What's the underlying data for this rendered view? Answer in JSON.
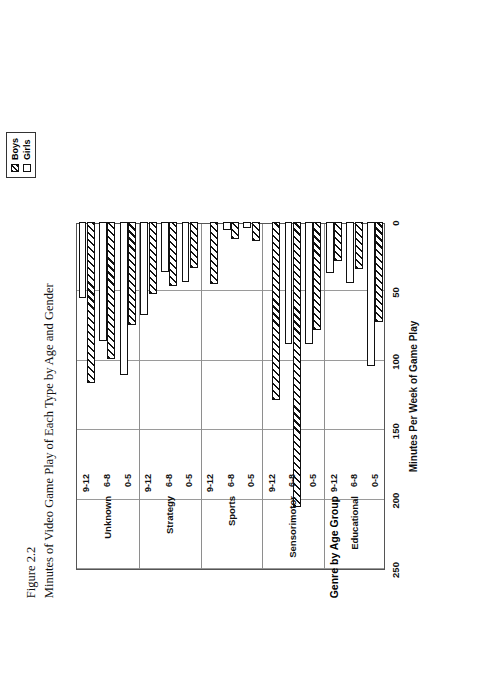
{
  "figure": {
    "number": "Figure 2.2",
    "title": "Minutes of Video Game Play of Each Type by Age and Gender"
  },
  "legend": {
    "position": "top-center",
    "entries": [
      {
        "label": "Boys",
        "pattern": "hatched"
      },
      {
        "label": "Girls",
        "pattern": "white"
      }
    ]
  },
  "chart_data": {
    "type": "bar",
    "orientation": "horizontal",
    "title": "Minutes of Video Game Play of Each Type by Age and Gender",
    "xlabel": "Genre by Age Group",
    "ylabel": "Minutes Per Week of Game Play",
    "ylim": [
      0,
      250
    ],
    "yticks": [
      0,
      50,
      100,
      150,
      200,
      250
    ],
    "grid": true,
    "legend_position": "top-center",
    "groups": [
      "Educational",
      "Sensorimotor",
      "Sports",
      "Strategy",
      "Unknown"
    ],
    "age_bands": [
      "0-5",
      "6-8",
      "9-12"
    ],
    "categories": [
      "Educational 0-5",
      "Educational 6-8",
      "Educational 9-12",
      "Sensorimotor 0-5",
      "Sensorimotor 6-8",
      "Sensorimotor 9-12",
      "Sports 0-5",
      "Sports 6-8",
      "Sports 9-12",
      "Strategy 0-5",
      "Strategy 6-8",
      "Strategy 9-12",
      "Unknown 0-5",
      "Unknown 6-8",
      "Unknown 9-12"
    ],
    "series": [
      {
        "name": "Boys",
        "pattern": "hatched",
        "values": [
          72,
          34,
          28,
          78,
          205,
          128,
          14,
          12,
          45,
          33,
          46,
          52,
          74,
          99,
          116
        ]
      },
      {
        "name": "Girls",
        "pattern": "white",
        "values": [
          104,
          44,
          37,
          88,
          88,
          0,
          4,
          6,
          0,
          43,
          36,
          67,
          110,
          86,
          55
        ]
      }
    ]
  },
  "axis": {
    "value_ticks": [
      "0",
      "50",
      "100",
      "150",
      "200",
      "250"
    ],
    "value_title": "Minutes Per Week of Game Play",
    "category_title": "Genre by Age Group"
  }
}
